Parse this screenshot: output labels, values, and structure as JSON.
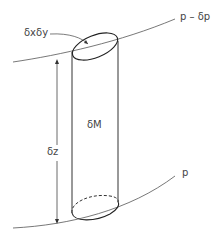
{
  "diagram": {
    "labels": {
      "area": "δxδy",
      "top_surface": "p – δp",
      "mass": "δM",
      "height": "δz",
      "bottom_surface": "p"
    },
    "colors": {
      "stroke": "#333333",
      "background": "#ffffff"
    }
  }
}
